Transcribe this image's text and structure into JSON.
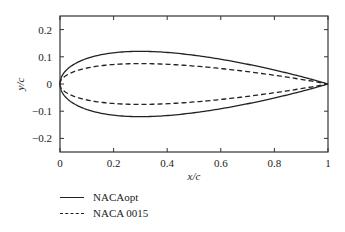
{
  "chart_data": {
    "type": "line",
    "title": "",
    "xlabel": "x/c",
    "ylabel": "y/c",
    "xlim": [
      0,
      1
    ],
    "ylim": [
      -0.25,
      0.25
    ],
    "xticks": [
      0,
      0.2,
      0.4,
      0.6,
      0.8,
      1
    ],
    "xtick_labels": [
      "0",
      "0.2",
      "0.4",
      "0.6",
      "0.8",
      "1"
    ],
    "yticks": [
      -0.2,
      -0.1,
      0,
      0.1,
      0.2
    ],
    "ytick_labels": [
      "−0.2",
      "−0.1",
      "0",
      "0.1",
      "0.2"
    ],
    "grid": false,
    "legend_position": "below-left",
    "series": [
      {
        "name": "NACAopt",
        "style": "solid",
        "thickness_ratio": 0.24,
        "x": [
          0,
          0.0125,
          0.025,
          0.05,
          0.1,
          0.15,
          0.2,
          0.3,
          0.4,
          0.5,
          0.6,
          0.7,
          0.8,
          0.9,
          0.95,
          1.0
        ],
        "upper_y": [
          0,
          0.038,
          0.052,
          0.071,
          0.094,
          0.108,
          0.116,
          0.12,
          0.116,
          0.106,
          0.091,
          0.073,
          0.052,
          0.029,
          0.016,
          0.002
        ],
        "lower_y": [
          0,
          -0.038,
          -0.052,
          -0.071,
          -0.094,
          -0.108,
          -0.116,
          -0.12,
          -0.116,
          -0.106,
          -0.091,
          -0.073,
          -0.052,
          -0.029,
          -0.016,
          -0.002
        ]
      },
      {
        "name": "NACA 0015",
        "style": "dashed",
        "thickness_ratio": 0.15,
        "x": [
          0,
          0.0125,
          0.025,
          0.05,
          0.1,
          0.15,
          0.2,
          0.3,
          0.4,
          0.5,
          0.6,
          0.7,
          0.8,
          0.9,
          0.95,
          1.0
        ],
        "upper_y": [
          0,
          0.0237,
          0.0327,
          0.0444,
          0.0585,
          0.0668,
          0.0717,
          0.075,
          0.0725,
          0.0662,
          0.057,
          0.0458,
          0.033,
          0.0181,
          0.0101,
          0.0016
        ],
        "lower_y": [
          0,
          -0.0237,
          -0.0327,
          -0.0444,
          -0.0585,
          -0.0668,
          -0.0717,
          -0.075,
          -0.0725,
          -0.0662,
          -0.057,
          -0.0458,
          -0.033,
          -0.0181,
          -0.0101,
          -0.0016
        ]
      }
    ]
  },
  "legend": {
    "items": [
      {
        "label": "NACAopt",
        "style": "solid"
      },
      {
        "label": "NACA 0015",
        "style": "dashed"
      }
    ]
  },
  "colors": {
    "line": "#222222",
    "axes": "#333333",
    "background": "#ffffff"
  }
}
